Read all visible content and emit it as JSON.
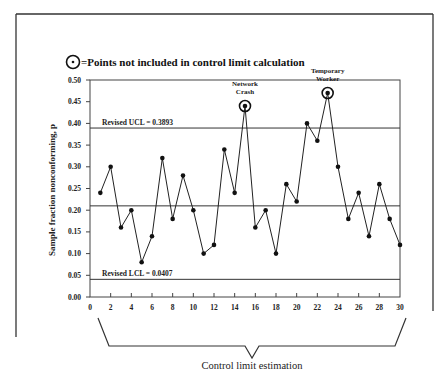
{
  "chart_data": {
    "type": "line",
    "title": "",
    "legend": {
      "symbol": "circled-dot",
      "text": "=Points not included in control limit calculation",
      "placement": "top-left"
    },
    "xlabel": "",
    "ylabel": "Sample fraction nonconforming, p",
    "xlim": [
      0,
      30
    ],
    "ylim": [
      0,
      0.5
    ],
    "x_ticks": [
      "0",
      "2",
      "4",
      "6",
      "8",
      "10",
      "12",
      "14",
      "16",
      "18",
      "20",
      "22",
      "24",
      "26",
      "28",
      "30"
    ],
    "y_ticks": [
      "0.00",
      "0.05",
      "0.10",
      "0.15",
      "0.20",
      "0.25",
      "0.30",
      "0.35",
      "0.40",
      "0.45",
      "0.50"
    ],
    "x": [
      1,
      2,
      3,
      4,
      5,
      6,
      7,
      8,
      9,
      10,
      11,
      12,
      13,
      14,
      15,
      16,
      17,
      18,
      19,
      20,
      21,
      22,
      23,
      24,
      25,
      26,
      27,
      28,
      29,
      30
    ],
    "series": [
      {
        "name": "p",
        "values": [
          0.24,
          0.3,
          0.16,
          0.2,
          0.08,
          0.14,
          0.32,
          0.18,
          0.28,
          0.2,
          0.1,
          0.12,
          0.34,
          0.24,
          0.44,
          0.16,
          0.2,
          0.1,
          0.26,
          0.22,
          0.4,
          0.36,
          0.47,
          0.3,
          0.18,
          0.24,
          0.14,
          0.26,
          0.18,
          0.12
        ]
      }
    ],
    "excluded_points": [
      15,
      23
    ],
    "reference_lines": [
      {
        "name": "ucl",
        "label": "Revised  UCL = 0.3893",
        "value": 0.3893
      },
      {
        "name": "center",
        "label": "",
        "value": 0.21
      },
      {
        "name": "lcl",
        "label": "Revised LCL = 0.0407",
        "value": 0.0407
      }
    ],
    "annotations": [
      {
        "x": 15,
        "lines": [
          "Network",
          "Crash"
        ]
      },
      {
        "x": 23,
        "lines": [
          "Temporary",
          "Worker"
        ]
      }
    ],
    "bracket_label": "Control limit estimation",
    "grid": false
  }
}
